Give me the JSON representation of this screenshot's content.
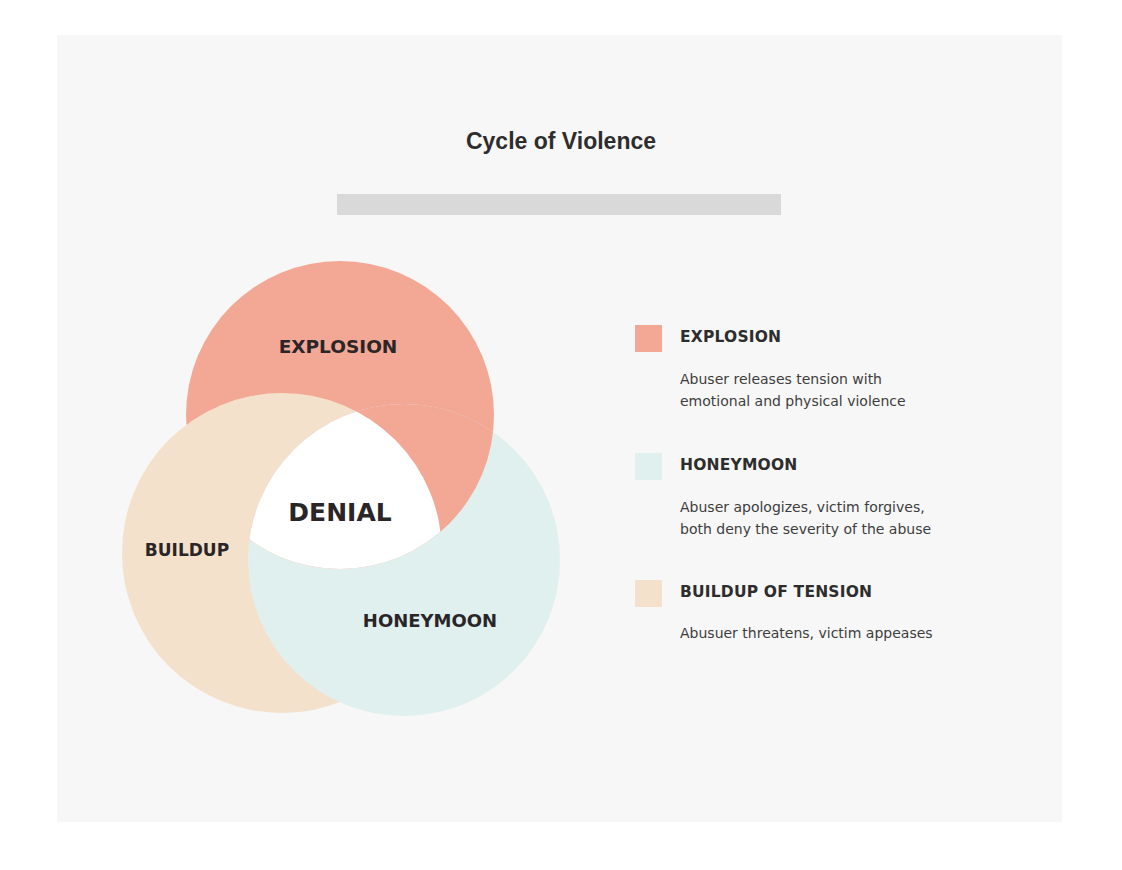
{
  "title": "Cycle of Violence",
  "colors": {
    "explosion": "#f3a795",
    "honeymoon": "#dff0ee",
    "buildup": "#f3e1cb",
    "center": "#ffffff",
    "text": "#2a2527",
    "card": "#f7f7f7",
    "title_bar": "#d9d9d9"
  },
  "diagram": {
    "center_label": "DENIAL",
    "circles": [
      {
        "id": "explosion",
        "label": "EXPLOSION"
      },
      {
        "id": "buildup",
        "label": "BUILDUP"
      },
      {
        "id": "honeymoon",
        "label": "HONEYMOON"
      }
    ]
  },
  "legend": [
    {
      "id": "explosion",
      "title": "EXPLOSION",
      "lines": [
        "Abuser releases tension with",
        "emotional and physical violence"
      ]
    },
    {
      "id": "honeymoon",
      "title": "HONEYMOON",
      "lines": [
        "Abuser apologizes, victim forgives,",
        "both deny the severity of the abuse"
      ]
    },
    {
      "id": "buildup",
      "title": "BUILDUP OF TENSION",
      "lines": [
        "Abusuer threatens, victim appeases"
      ]
    }
  ]
}
